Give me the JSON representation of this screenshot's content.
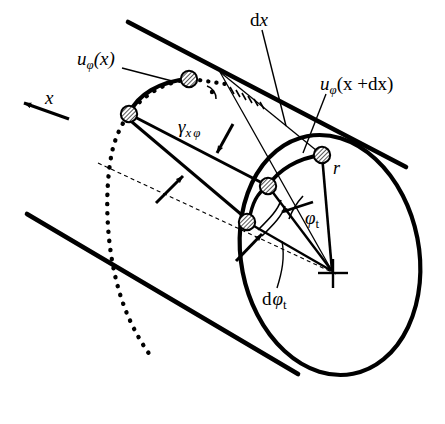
{
  "figure": {
    "kind": "engineering-diagram",
    "background_color": "#ffffff",
    "ink_color": "#000000",
    "width": 445,
    "height": 424
  },
  "labels": {
    "axis_x": {
      "text": "x",
      "style": "italic",
      "x": 45,
      "y": 95
    },
    "u_phi_x": {
      "base": "u",
      "sub": "φ",
      "arg": "(x)",
      "x": 77,
      "y": 56
    },
    "dx": {
      "d": "d",
      "x": "x",
      "pos_x": 250,
      "pos_y": 16
    },
    "u_phi_x_dx": {
      "base": "u",
      "sub": "φ",
      "arg": "(x +dx)",
      "x": 320,
      "y": 81
    },
    "gamma_x_phi": {
      "base": "γ",
      "sub1": "x",
      "sub2": "φ",
      "x": 178,
      "y": 124
    },
    "radius_r": {
      "text": "r",
      "style": "italic",
      "x": 333,
      "y": 166
    },
    "phi_t": {
      "base": "φ",
      "sub": "t",
      "x": 305,
      "y": 215
    },
    "d_phi_t": {
      "d": "d",
      "base": "φ",
      "sub": "t",
      "x": 262,
      "y": 296
    }
  },
  "geometry": {
    "cylinder": {
      "top_edge": {
        "x1": 128,
        "y1": 22,
        "x2": 404,
        "y2": 166
      },
      "bottom_edge": {
        "x1": 28,
        "y1": 214,
        "x2": 296,
        "y2": 373
      },
      "right_section_ellipse": {
        "cx": 330,
        "cy": 255,
        "rx": 90,
        "ry": 122,
        "rotation": -12
      },
      "left_section_arc_dotted": true,
      "axis_dashed_line": {
        "x1": 100,
        "y1": 164,
        "x2": 332,
        "y2": 272
      }
    },
    "nodes": [
      {
        "name": "node-top-left",
        "x": 129,
        "y": 114
      },
      {
        "name": "node-top-right",
        "x": 189,
        "y": 80
      },
      {
        "name": "node-bottom-left",
        "x": 247,
        "y": 222
      },
      {
        "name": "node-bottom-right",
        "x": 268,
        "y": 186
      },
      {
        "name": "node-rim",
        "x": 322,
        "y": 155
      }
    ],
    "center_marker": {
      "x": 332,
      "y": 273,
      "type": "cross"
    },
    "right_angle_marker": {
      "x": 215,
      "y": 89
    }
  }
}
